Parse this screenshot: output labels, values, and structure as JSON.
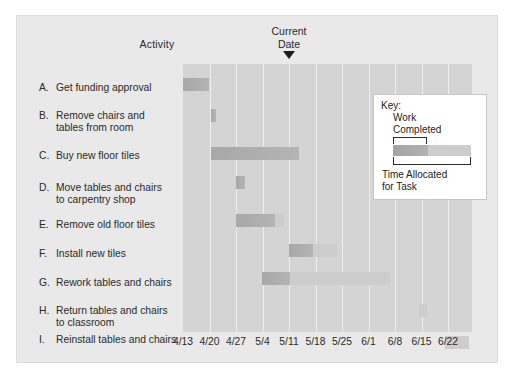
{
  "figure": {
    "activity_header": "Activity",
    "current_date_line1": "Current",
    "current_date_line2": "Date"
  },
  "legend": {
    "key_label": "Key:",
    "work_completed": "Work\nCompleted",
    "work_completed_line1": "Work",
    "work_completed_line2": "Completed",
    "time_allocated_line1": "Time Allocated",
    "time_allocated_line2": "for Task"
  },
  "colors": {
    "figure_background": "#e9e9e9",
    "plot_background": "#d4d4d4",
    "gridline": "#eeeeee",
    "work_completed_bar": "#acacac",
    "time_allocated_bar": "#cdcdcd",
    "text": "#2a2a2a",
    "marker": "#1c1c1c",
    "legend_background": "#ffffff"
  },
  "chart_data": {
    "type": "bar",
    "chart_kind": "gantt",
    "title": "",
    "xlabel": "",
    "ylabel": "Activity",
    "grid": true,
    "legend_position": "inside-top-right",
    "x_tick_labels": [
      "4/13",
      "4/20",
      "4/27",
      "5/4",
      "5/11",
      "5/18",
      "5/25",
      "6/1",
      "6/8",
      "6/15",
      "6/22"
    ],
    "x_axis_start": "4/13",
    "x_axis_end": "6/22",
    "current_date": "5/11",
    "legend_series": [
      "Work Completed",
      "Time Allocated for Task"
    ],
    "categories": [
      "A. Get funding approval",
      "B. Remove chairs and tables from room",
      "C. Buy new floor tiles",
      "D. Move tables and chairs to carpentry shop",
      "E. Remove old floor tiles",
      "F. Install new tiles",
      "G. Rework tables and chairs",
      "H. Return tables and chairs to classroom",
      "I. Reinstall tables and chairs"
    ],
    "tasks": [
      {
        "letter": "A.",
        "label_line1": "Get funding approval",
        "label_line2": "",
        "start": "4/13",
        "end": "4/18",
        "completed_end": "4/18",
        "work_completed_pct": 100
      },
      {
        "letter": "B.",
        "label_line1": "Remove chairs and",
        "label_line2": "tables from room",
        "start": "4/20",
        "end": "4/21",
        "completed_end": "4/21",
        "work_completed_pct": 100
      },
      {
        "letter": "C.",
        "label_line1": "Buy new floor tiles",
        "label_line2": "",
        "start": "4/20",
        "end": "5/11",
        "completed_end": "5/11",
        "work_completed_pct": 100
      },
      {
        "letter": "D.",
        "label_line1": "Move tables and chairs",
        "label_line2": "to carpentry shop",
        "start": "4/26",
        "end": "4/28",
        "completed_end": "4/28",
        "work_completed_pct": 100
      },
      {
        "letter": "E.",
        "label_line1": "Remove old floor tiles",
        "label_line2": "",
        "start": "4/26",
        "end": "5/12",
        "completed_end": "5/9",
        "work_completed_pct": 82
      },
      {
        "letter": "F.",
        "label_line1": "Install new tiles",
        "label_line2": "",
        "start": "5/11",
        "end": "5/25",
        "completed_end": "5/18",
        "work_completed_pct": 50
      },
      {
        "letter": "G.",
        "label_line1": "Rework tables and chairs",
        "label_line2": "",
        "start": "5/4",
        "end": "6/8",
        "completed_end": "5/11",
        "work_completed_pct": 20
      },
      {
        "letter": "H.",
        "label_line1": "Return tables and chairs",
        "label_line2": "to classroom",
        "start": "6/8",
        "end": "6/9",
        "completed_end": "6/8",
        "work_completed_pct": 0
      },
      {
        "letter": "I.",
        "label_line1": "Reinstall tables and chairs",
        "label_line2": "",
        "start": "6/15",
        "end": "6/21",
        "completed_end": "6/15",
        "work_completed_pct": 0
      }
    ]
  },
  "geometry": {
    "plot_left": 166,
    "plot_top": 48,
    "plot_width": 289,
    "plot_height": 268,
    "tick_spacing": 26.5,
    "row_tops": [
      14,
      45,
      83,
      112,
      150,
      180,
      208,
      240,
      272
    ],
    "label_tops": [
      66,
      94,
      134,
      166,
      203,
      232,
      261,
      289,
      318
    ],
    "bars": [
      {
        "x": 0,
        "done": 26,
        "alloc": 0
      },
      {
        "x": 28,
        "done": 5,
        "alloc": 0
      },
      {
        "x": 28,
        "done": 88,
        "alloc": 0
      },
      {
        "x": 53,
        "done": 9,
        "alloc": 0
      },
      {
        "x": 53,
        "done": 39,
        "alloc": 9
      },
      {
        "x": 106,
        "done": 24,
        "alloc": 24
      },
      {
        "x": 79,
        "done": 28,
        "alloc": 100
      },
      {
        "x": 236,
        "done": 0,
        "alloc": 8
      },
      {
        "x": 262,
        "done": 0,
        "alloc": 24
      }
    ]
  }
}
